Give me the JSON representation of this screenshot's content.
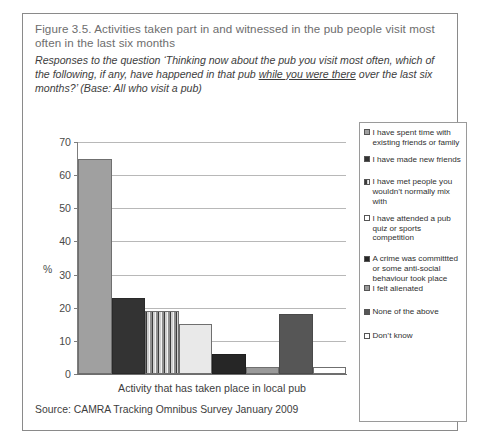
{
  "figure": {
    "title": "Figure 3.5. Activities taken part in and witnessed in the pub people visit most often in the last six months",
    "subtitle_part1": "Responses to the question ‘Thinking now about the pub you visit most often, which of the following, if any, have happened in that pub ",
    "subtitle_underlined": "while you were there",
    "subtitle_part2": " over the last six months?’ (Base: All who visit a pub)",
    "source": "Source: CAMRA Tracking Omnibus Survey January 2009"
  },
  "chart_data": {
    "type": "bar",
    "title": "Activities taken part in and witnessed in the pub people visit most often in the last six months",
    "xlabel": "Activity that has taken place in local pub",
    "ylabel": "%",
    "ylim": [
      0,
      70
    ],
    "yticks": [
      0,
      10,
      20,
      30,
      40,
      50,
      60,
      70
    ],
    "grid": true,
    "legend_position": "right",
    "categories": [
      "I have spent time with existing friends or family",
      "I have made new friends",
      "I have met people you wouldn’t normally mix with",
      "I have attended a pub quiz or sports competition",
      "A crime was committted or some anti-social behaviour took place",
      "I felt alienated",
      "None of the above",
      "Don’t know"
    ],
    "values": [
      65,
      23,
      19,
      15,
      6,
      2,
      18,
      2
    ],
    "colors": [
      "#a0a0a0",
      "#333333",
      "#7a7a7a",
      "#e9e9e9",
      "#262626",
      "#9a9a9a",
      "#565656",
      "#ffffff"
    ]
  },
  "legend": {
    "items": [
      {
        "label": "I have spent time with existing friends or family",
        "swatch": "#a0a0a0"
      },
      {
        "label": "I have made new friends",
        "swatch": "#333333"
      },
      {
        "label": "I have met people you wouldn’t normally mix with",
        "swatch": "#7a7a7a"
      },
      {
        "label": "I have attended a pub quiz or sports competition",
        "swatch": "#ffffff"
      },
      {
        "label": "A crime was committted or some anti-social behaviour took place",
        "swatch": "#262626"
      },
      {
        "label": "I felt alienated",
        "swatch": "#9a9a9a"
      },
      {
        "label": "None of the above",
        "swatch": "#565656"
      },
      {
        "label": "Don’t know",
        "swatch": "#ffffff"
      }
    ]
  }
}
